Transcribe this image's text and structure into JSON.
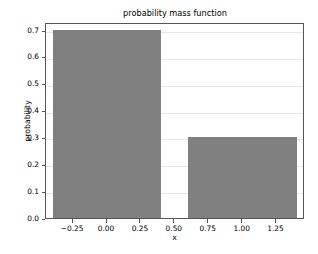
{
  "chart_data": {
    "type": "bar",
    "title": "probability mass function",
    "xlabel": "x",
    "ylabel": "probability",
    "categories": [
      "0",
      "1"
    ],
    "x": [
      0,
      1
    ],
    "values": [
      0.7,
      0.3
    ],
    "bar_width": 0.8,
    "bar_color": "#808080",
    "xlim": [
      -0.45,
      1.46
    ],
    "ylim": [
      0.0,
      0.73
    ],
    "yticks": [
      0.0,
      0.1,
      0.2,
      0.3,
      0.4,
      0.5,
      0.6,
      0.7
    ],
    "ytick_labels": [
      "0.0",
      "0.1",
      "0.2",
      "0.3",
      "0.4",
      "0.5",
      "0.6",
      "0.7"
    ],
    "xticks": [
      -0.25,
      0.0,
      0.25,
      0.5,
      0.75,
      1.0,
      1.25
    ],
    "xtick_labels": [
      "−0.25",
      "0.00",
      "0.25",
      "0.50",
      "0.75",
      "1.00",
      "1.25"
    ],
    "grid": "horizontal",
    "grid_color": "#e6e6e6",
    "legend": null,
    "background": "#ffffff",
    "spine_color": "#555555"
  }
}
